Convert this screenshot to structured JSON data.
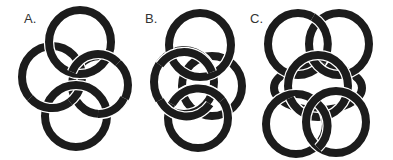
{
  "figure": {
    "panels": [
      {
        "label": "A.",
        "label_pos": [
          24,
          11
        ]
      },
      {
        "label": "B.",
        "label_pos": [
          145,
          11
        ]
      },
      {
        "label": "C.",
        "label_pos": [
          250,
          11
        ]
      }
    ],
    "ring_color": "#1c1c1c",
    "gap_color": "#ffffff"
  }
}
